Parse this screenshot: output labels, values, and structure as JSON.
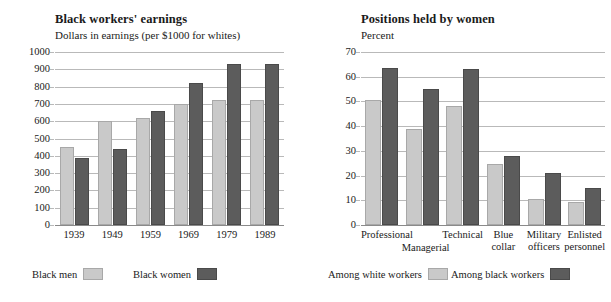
{
  "charts": [
    {
      "title": "Black workers' earnings",
      "subtitle": "Dollars in earnings (per $1000 for whites)",
      "legend": [
        {
          "label": "Black men",
          "swatch": "light"
        },
        {
          "label": "Black women",
          "swatch": "dark"
        }
      ]
    },
    {
      "title": "Positions held by women",
      "subtitle": "Percent",
      "legend": [
        {
          "label": "Among white workers",
          "swatch": "light"
        },
        {
          "label": "Among black workers",
          "swatch": "dark"
        }
      ]
    }
  ],
  "colors": {
    "light_series": "#c9c9c9",
    "dark_series": "#5c5c5c",
    "gridline": "#b9b9b9",
    "text": "#1a1a1a",
    "background": "#ffffff"
  },
  "chart_data": [
    {
      "type": "bar",
      "title": "Black workers' earnings",
      "subtitle": "Dollars in earnings (per $1000 for whites)",
      "xlabel": "",
      "ylabel": "Dollars in earnings (per $1000 for whites)",
      "ylim": [
        0,
        1000
      ],
      "yticks": [
        0,
        100,
        200,
        300,
        400,
        500,
        600,
        700,
        800,
        900,
        1000
      ],
      "grid": true,
      "legend_position": "bottom",
      "categories": [
        "1939",
        "1949",
        "1959",
        "1969",
        "1979",
        "1989"
      ],
      "series": [
        {
          "name": "Black men",
          "color": "#c9c9c9",
          "values": [
            450,
            600,
            620,
            700,
            720,
            720
          ]
        },
        {
          "name": "Black women",
          "color": "#5c5c5c",
          "values": [
            390,
            440,
            660,
            820,
            930,
            930
          ]
        }
      ]
    },
    {
      "type": "bar",
      "title": "Positions held by women",
      "subtitle": "Percent",
      "xlabel": "",
      "ylabel": "Percent",
      "ylim": [
        0,
        70
      ],
      "yticks": [
        0,
        10,
        20,
        30,
        40,
        50,
        60,
        70
      ],
      "grid": true,
      "legend_position": "bottom",
      "categories": [
        "Professional",
        "Managerial",
        "Technical",
        "Blue collar",
        "Military officers",
        "Enlisted personnel"
      ],
      "series": [
        {
          "name": "Among white workers",
          "color": "#c9c9c9",
          "values": [
            50.5,
            39,
            48,
            24.5,
            10.5,
            9.5
          ]
        },
        {
          "name": "Among black workers",
          "color": "#5c5c5c",
          "values": [
            63.5,
            55,
            63,
            28,
            21,
            15
          ]
        }
      ]
    }
  ],
  "axis_labels": {
    "left_years": [
      "1939",
      "1949",
      "1959",
      "1969",
      "1979",
      "1989"
    ],
    "right_categories": [
      {
        "line1": "Professional",
        "line2": "",
        "row": 0
      },
      {
        "line1": "Managerial",
        "line2": "",
        "row": 1
      },
      {
        "line1": "Technical",
        "line2": "",
        "row": 0
      },
      {
        "line1": "Blue",
        "line2": "collar",
        "row": 0
      },
      {
        "line1": "Military",
        "line2": "officers",
        "row": 0
      },
      {
        "line1": "Enlisted",
        "line2": "personnel",
        "row": 0
      }
    ]
  }
}
